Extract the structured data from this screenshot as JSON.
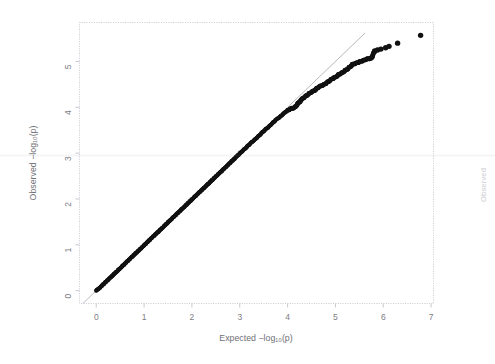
{
  "figure": {
    "name": "qq-plot",
    "background_color": "#ffffff",
    "point_color": "#111111",
    "reference_line_color": "#9a9aa2",
    "frame_color": "#c9c9d2",
    "tick_label_color": "#7d7d84"
  },
  "edge_fragment": {
    "text": "Observed",
    "color": "#b9b9c0"
  },
  "chart_data": {
    "type": "scatter",
    "title": "",
    "xlabel": "Expected -log10(p)",
    "ylabel": "Observed -log10(p)",
    "xlabel_display": "Expected −log₁₀(p)",
    "ylabel_display": "Observed −log₁₀(p)",
    "xlim": [
      -0.35,
      7.05
    ],
    "ylim": [
      -0.28,
      5.85
    ],
    "xticks": [
      0,
      1,
      2,
      3,
      4,
      5,
      6,
      7
    ],
    "xtick_labels": [
      "0",
      "1",
      "2",
      "3",
      "4",
      "5",
      "6",
      "7"
    ],
    "yticks": [
      0,
      1,
      2,
      3,
      4,
      5
    ],
    "ytick_labels": [
      "0",
      "1",
      "2",
      "3",
      "4",
      "5"
    ],
    "grid": false,
    "legend": null,
    "annotations": [],
    "reference_line": {
      "name": "y = x identity line",
      "slope": 1.0,
      "intercept": 0.0,
      "x_from": -0.28,
      "x_to": 5.62,
      "style": "thin solid gray"
    },
    "series": [
      {
        "name": "observed p-values",
        "marker": "filled circle",
        "color": "#111111",
        "comment": "dense band of ~1200 points along the diagonal plus a sparse upper tail",
        "points": [
          [
            0.0,
            0.0
          ],
          [
            0.03,
            0.03
          ],
          [
            0.06,
            0.05
          ],
          [
            0.09,
            0.08
          ],
          [
            0.12,
            0.11
          ],
          [
            0.15,
            0.14
          ],
          [
            0.18,
            0.17
          ],
          [
            0.21,
            0.2
          ],
          [
            0.24,
            0.23
          ],
          [
            0.27,
            0.26
          ],
          [
            0.3,
            0.29
          ],
          [
            0.33,
            0.32
          ],
          [
            0.36,
            0.35
          ],
          [
            0.39,
            0.38
          ],
          [
            0.42,
            0.41
          ],
          [
            0.45,
            0.44
          ],
          [
            0.48,
            0.47
          ],
          [
            0.51,
            0.5
          ],
          [
            0.54,
            0.53
          ],
          [
            0.57,
            0.56
          ],
          [
            0.6,
            0.59
          ],
          [
            0.63,
            0.62
          ],
          [
            0.66,
            0.65
          ],
          [
            0.69,
            0.68
          ],
          [
            0.72,
            0.71
          ],
          [
            0.75,
            0.74
          ],
          [
            0.78,
            0.77
          ],
          [
            0.81,
            0.8
          ],
          [
            0.84,
            0.83
          ],
          [
            0.87,
            0.86
          ],
          [
            0.9,
            0.89
          ],
          [
            0.93,
            0.92
          ],
          [
            0.96,
            0.95
          ],
          [
            0.99,
            0.98
          ],
          [
            1.02,
            1.01
          ],
          [
            1.05,
            1.04
          ],
          [
            1.08,
            1.07
          ],
          [
            1.11,
            1.1
          ],
          [
            1.14,
            1.13
          ],
          [
            1.17,
            1.16
          ],
          [
            1.2,
            1.19
          ],
          [
            1.23,
            1.22
          ],
          [
            1.26,
            1.25
          ],
          [
            1.29,
            1.28
          ],
          [
            1.32,
            1.31
          ],
          [
            1.35,
            1.34
          ],
          [
            1.38,
            1.37
          ],
          [
            1.41,
            1.4
          ],
          [
            1.44,
            1.43
          ],
          [
            1.47,
            1.46
          ],
          [
            1.5,
            1.49
          ],
          [
            1.53,
            1.52
          ],
          [
            1.56,
            1.55
          ],
          [
            1.59,
            1.58
          ],
          [
            1.62,
            1.61
          ],
          [
            1.65,
            1.64
          ],
          [
            1.68,
            1.67
          ],
          [
            1.71,
            1.7
          ],
          [
            1.74,
            1.73
          ],
          [
            1.77,
            1.76
          ],
          [
            1.8,
            1.79
          ],
          [
            1.83,
            1.82
          ],
          [
            1.86,
            1.85
          ],
          [
            1.89,
            1.88
          ],
          [
            1.92,
            1.91
          ],
          [
            1.95,
            1.94
          ],
          [
            1.98,
            1.97
          ],
          [
            2.01,
            2.0
          ],
          [
            2.04,
            2.03
          ],
          [
            2.07,
            2.06
          ],
          [
            2.1,
            2.09
          ],
          [
            2.13,
            2.12
          ],
          [
            2.16,
            2.15
          ],
          [
            2.19,
            2.18
          ],
          [
            2.22,
            2.21
          ],
          [
            2.25,
            2.24
          ],
          [
            2.28,
            2.27
          ],
          [
            2.31,
            2.3
          ],
          [
            2.34,
            2.33
          ],
          [
            2.37,
            2.36
          ],
          [
            2.4,
            2.39
          ],
          [
            2.43,
            2.42
          ],
          [
            2.46,
            2.45
          ],
          [
            2.49,
            2.48
          ],
          [
            2.52,
            2.51
          ],
          [
            2.55,
            2.54
          ],
          [
            2.58,
            2.57
          ],
          [
            2.61,
            2.6
          ],
          [
            2.64,
            2.63
          ],
          [
            2.67,
            2.66
          ],
          [
            2.7,
            2.69
          ],
          [
            2.73,
            2.72
          ],
          [
            2.76,
            2.75
          ],
          [
            2.79,
            2.78
          ],
          [
            2.82,
            2.81
          ],
          [
            2.85,
            2.84
          ],
          [
            2.88,
            2.87
          ],
          [
            2.91,
            2.9
          ],
          [
            2.94,
            2.93
          ],
          [
            2.97,
            2.96
          ],
          [
            3.0,
            2.99
          ],
          [
            3.05,
            3.04
          ],
          [
            3.1,
            3.09
          ],
          [
            3.15,
            3.14
          ],
          [
            3.2,
            3.19
          ],
          [
            3.25,
            3.24
          ],
          [
            3.3,
            3.28
          ],
          [
            3.35,
            3.33
          ],
          [
            3.4,
            3.38
          ],
          [
            3.45,
            3.43
          ],
          [
            3.5,
            3.48
          ],
          [
            3.55,
            3.53
          ],
          [
            3.6,
            3.57
          ],
          [
            3.65,
            3.62
          ],
          [
            3.7,
            3.67
          ],
          [
            3.75,
            3.72
          ],
          [
            3.8,
            3.76
          ],
          [
            3.85,
            3.8
          ],
          [
            3.9,
            3.85
          ],
          [
            3.95,
            3.89
          ],
          [
            4.0,
            3.93
          ],
          [
            4.05,
            3.96
          ],
          [
            4.1,
            3.98
          ],
          [
            4.15,
            4.0
          ],
          [
            4.2,
            4.06
          ],
          [
            4.25,
            4.12
          ],
          [
            4.3,
            4.18
          ],
          [
            4.35,
            4.22
          ],
          [
            4.4,
            4.26
          ],
          [
            4.45,
            4.3
          ],
          [
            4.5,
            4.33
          ],
          [
            4.55,
            4.36
          ],
          [
            4.6,
            4.4
          ],
          [
            4.65,
            4.44
          ],
          [
            4.7,
            4.47
          ],
          [
            4.75,
            4.49
          ],
          [
            4.8,
            4.52
          ],
          [
            4.85,
            4.56
          ],
          [
            4.9,
            4.6
          ],
          [
            4.95,
            4.63
          ],
          [
            5.0,
            4.66
          ],
          [
            5.05,
            4.7
          ],
          [
            5.1,
            4.73
          ],
          [
            5.15,
            4.76
          ],
          [
            5.2,
            4.8
          ],
          [
            5.25,
            4.83
          ],
          [
            5.3,
            4.88
          ],
          [
            5.35,
            4.93
          ],
          [
            5.4,
            4.95
          ],
          [
            5.45,
            4.97
          ],
          [
            5.5,
            4.99
          ],
          [
            5.55,
            5.01
          ],
          [
            5.6,
            5.03
          ],
          [
            5.65,
            5.05
          ],
          [
            5.7,
            5.06
          ],
          [
            5.75,
            5.07
          ],
          [
            5.82,
            5.23
          ],
          [
            5.88,
            5.25
          ],
          [
            5.95,
            5.27
          ],
          [
            6.05,
            5.3
          ],
          [
            6.12,
            5.33
          ],
          [
            6.3,
            5.4
          ],
          [
            6.78,
            5.57
          ]
        ]
      }
    ]
  }
}
